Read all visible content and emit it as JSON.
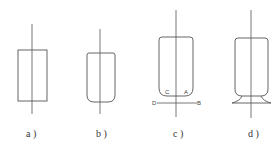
{
  "figure": {
    "panels": [
      {
        "id": "a",
        "caption": "a )",
        "shape": "rectangle with central axis"
      },
      {
        "id": "b",
        "caption": "b )",
        "shape": "cup with rounded bottom and central axis"
      },
      {
        "id": "c",
        "caption": "c )",
        "shape": "cup with rounded bottom, base line D-B and points C, A",
        "points": {
          "C": "C",
          "A": "A",
          "D": "D",
          "B": "B"
        }
      },
      {
        "id": "d",
        "caption": "d )",
        "shape": "cup with flared base and central axis"
      }
    ]
  }
}
